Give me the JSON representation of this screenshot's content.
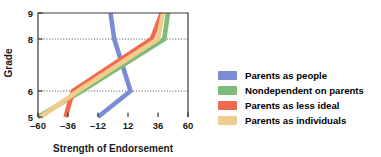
{
  "chart_data": {
    "type": "line",
    "title": "",
    "xlabel": "Strength of Endorsement",
    "ylabel": "Grade",
    "xlim": [
      -60,
      60
    ],
    "ylim": [
      5,
      9
    ],
    "xticks": [
      -60,
      -36,
      -12,
      12,
      36,
      60
    ],
    "xtick_labels": [
      "–60",
      "–36",
      "–12",
      "12",
      "36",
      "60"
    ],
    "yticks": [
      5,
      6,
      8,
      9
    ],
    "ytick_labels": [
      "5",
      "6",
      "8",
      "9"
    ],
    "grid": "horizontal-dotted-at-6-and-8",
    "legend_position": "right",
    "orientation": "y-is-grade-x-is-value",
    "series": [
      {
        "name": "Parents as people",
        "color": "#7b8cd4",
        "x": [
          -12,
          14,
          1,
          -2
        ],
        "y": [
          5,
          6,
          8,
          9
        ]
      },
      {
        "name": "Nondependent on parents",
        "color": "#7cbb78",
        "x": [
          -60,
          -25,
          41,
          44
        ],
        "y": [
          5,
          6,
          8,
          9
        ]
      },
      {
        "name": "Parents as less ideal",
        "color": "#ef6b50",
        "x": [
          -38,
          -32,
          31,
          39
        ],
        "y": [
          5,
          6,
          8,
          9
        ]
      },
      {
        "name": "Parents as individuals",
        "color": "#f0cd8e",
        "x": [
          -58,
          -28,
          36,
          40
        ],
        "y": [
          5,
          6,
          8,
          9
        ]
      }
    ]
  },
  "legend": {
    "items": [
      {
        "label": "Parents as people",
        "color": "#7b8cd4"
      },
      {
        "label": "Nondependent on parents",
        "color": "#7cbb78"
      },
      {
        "label": "Parents as less ideal",
        "color": "#ef6b50"
      },
      {
        "label": "Parents as individuals",
        "color": "#f0cd8e"
      }
    ]
  }
}
